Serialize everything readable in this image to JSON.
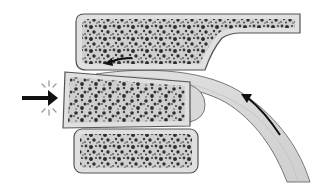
{
  "diagram": {
    "colors": {
      "bone_fill": "#d6d6d6",
      "bone_stroke": "#555555",
      "pore": "#3a3a3a",
      "ligament_fill": "#dcdcdc",
      "ligament_stroke": "#777777",
      "arrow": "#111111",
      "impact_rays": "#9a9a9a"
    },
    "elements": [
      {
        "name": "upper-vertebra",
        "type": "bone-block"
      },
      {
        "name": "middle-vertebra-displaced",
        "type": "bone-block"
      },
      {
        "name": "lower-vertebra",
        "type": "bone-block"
      },
      {
        "name": "ligament-band",
        "type": "curved-band"
      },
      {
        "name": "force-arrow",
        "direction": "right"
      },
      {
        "name": "rotation-arrow-upper",
        "direction": "left"
      },
      {
        "name": "ligament-arrow",
        "direction": "up-left"
      }
    ]
  }
}
